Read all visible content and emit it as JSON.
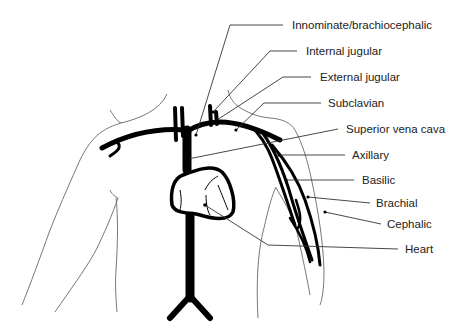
{
  "diagram": {
    "type": "anatomical-diagram",
    "labels": [
      {
        "id": "innominate",
        "text": "Innominate/brachiocephalic",
        "x": 292,
        "y": 19
      },
      {
        "id": "internal-jugular",
        "text": "Internal jugular",
        "x": 306,
        "y": 45
      },
      {
        "id": "external-jugular",
        "text": "External jugular",
        "x": 320,
        "y": 71
      },
      {
        "id": "subclavian",
        "text": "Subclavian",
        "x": 328,
        "y": 97
      },
      {
        "id": "superior-vena-cava",
        "text": "Superior vena cava",
        "x": 346,
        "y": 123
      },
      {
        "id": "axillary",
        "text": "Axillary",
        "x": 352,
        "y": 149
      },
      {
        "id": "basilic",
        "text": "Basilic",
        "x": 362,
        "y": 174
      },
      {
        "id": "brachial",
        "text": "Brachial",
        "x": 376,
        "y": 197
      },
      {
        "id": "cephalic",
        "text": "Cephalic",
        "x": 387,
        "y": 218
      },
      {
        "id": "heart",
        "text": "Heart",
        "x": 405,
        "y": 243
      }
    ],
    "colors": {
      "vessel": "#000000",
      "outline": "#666666",
      "leader": "#333333",
      "text": "#222222"
    }
  }
}
